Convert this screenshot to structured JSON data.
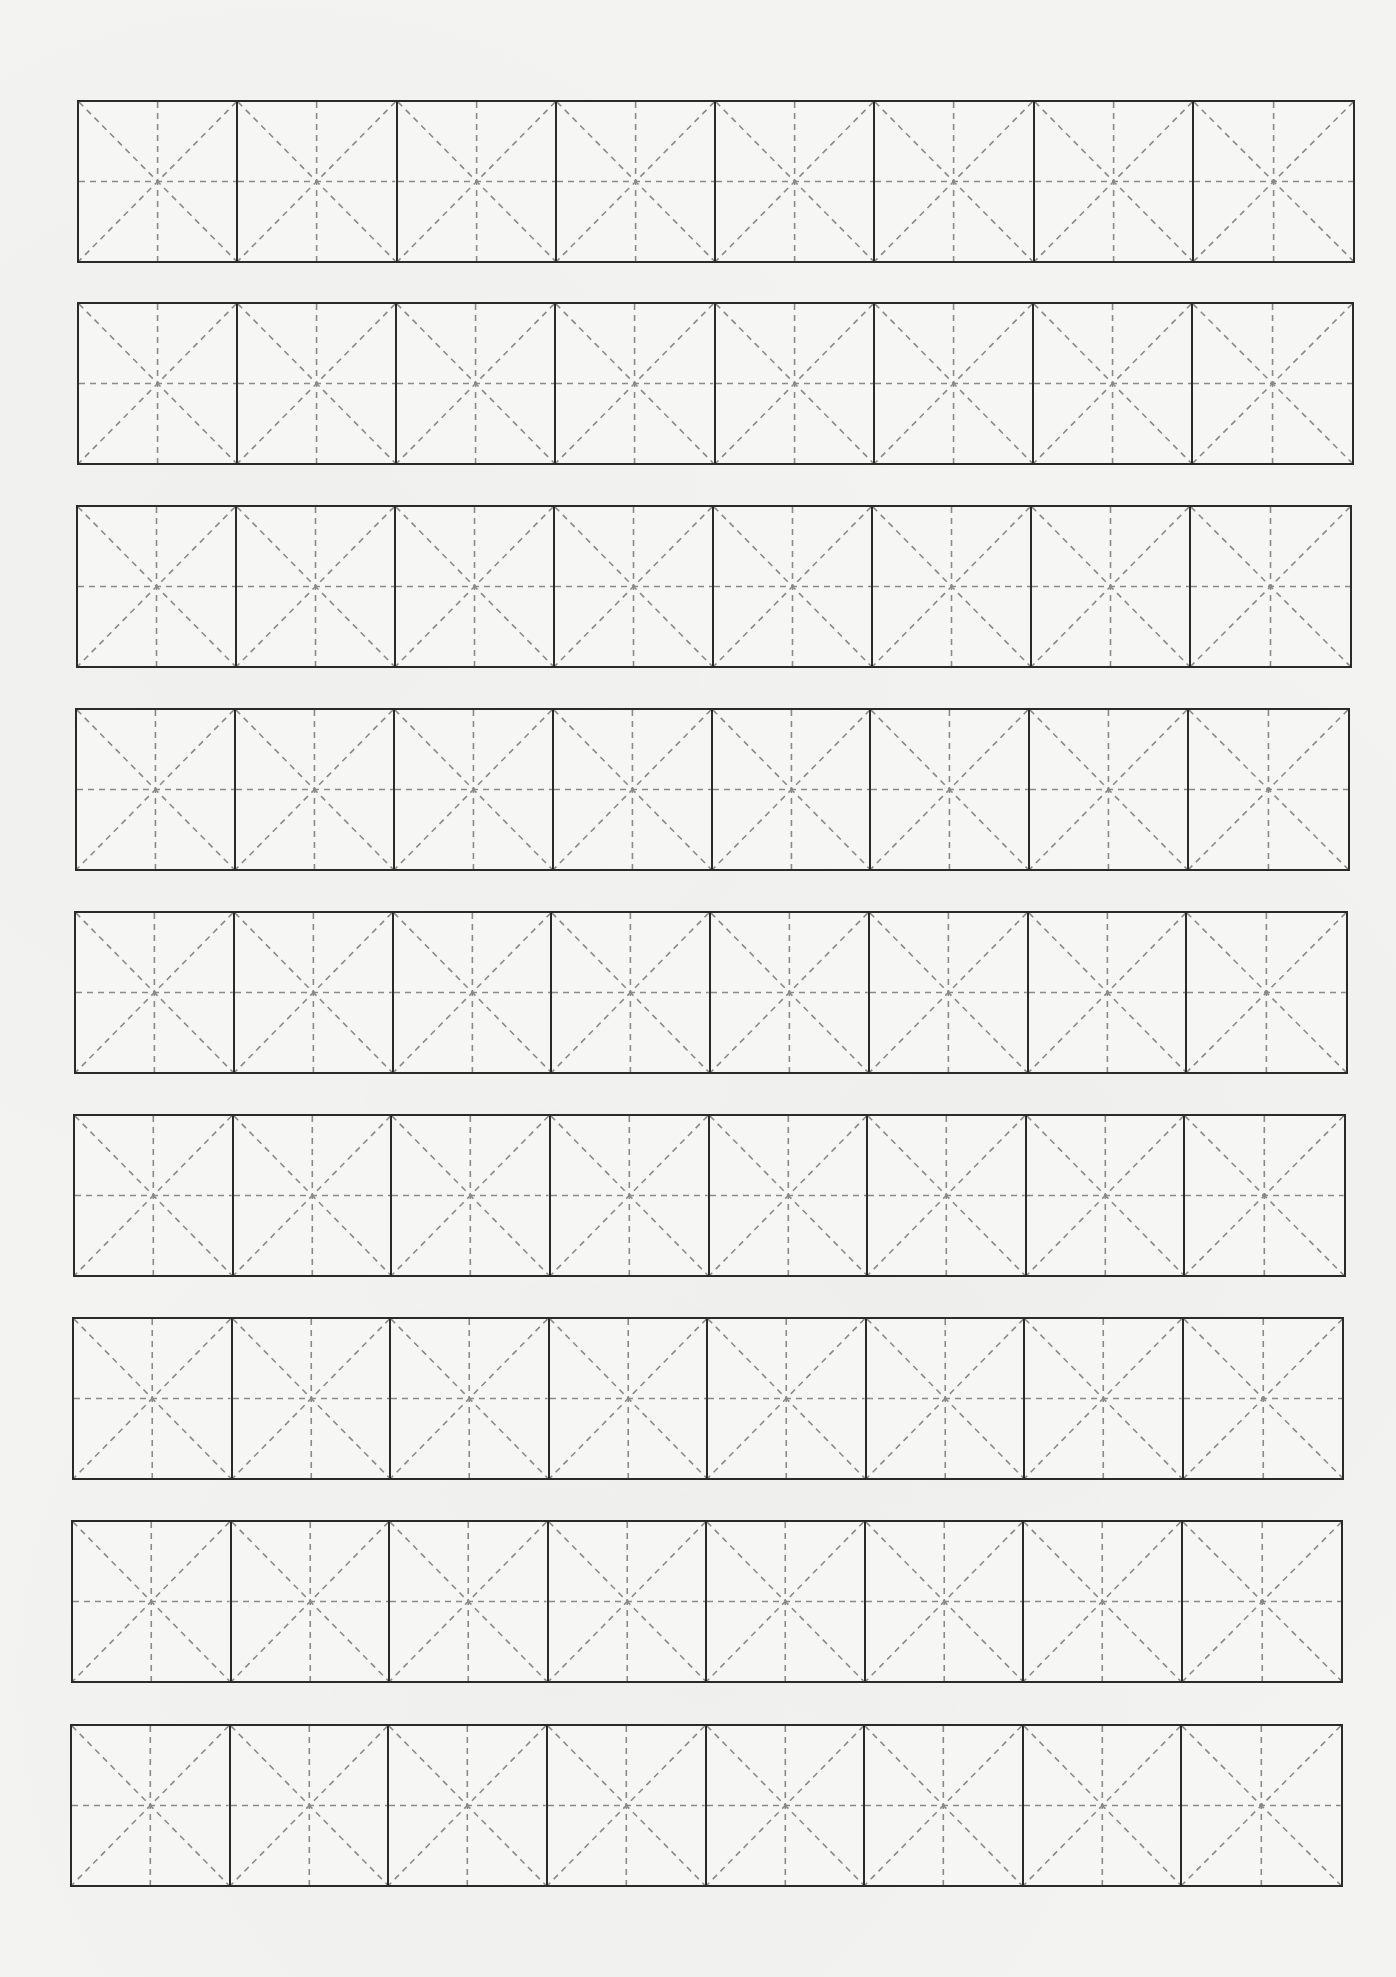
{
  "worksheet": {
    "type": "mi-zi-ge practice grid",
    "row_count": 9,
    "cells_per_row": 8,
    "cell_width_px": 159,
    "row_height_px": 163,
    "colors": {
      "paper": "#f3f3f1",
      "border": "#2a2a2a",
      "guide": "#8a8a8a"
    },
    "rows": [
      {
        "left": 77,
        "top": 100,
        "width": 1278
      },
      {
        "left": 77,
        "top": 302,
        "width": 1277
      },
      {
        "left": 76,
        "top": 505,
        "width": 1276
      },
      {
        "left": 75,
        "top": 708,
        "width": 1275
      },
      {
        "left": 74,
        "top": 911,
        "width": 1274
      },
      {
        "left": 73,
        "top": 1114,
        "width": 1273
      },
      {
        "left": 72,
        "top": 1317,
        "width": 1272
      },
      {
        "left": 71,
        "top": 1520,
        "width": 1272
      },
      {
        "left": 70,
        "top": 1724,
        "width": 1273
      }
    ]
  }
}
